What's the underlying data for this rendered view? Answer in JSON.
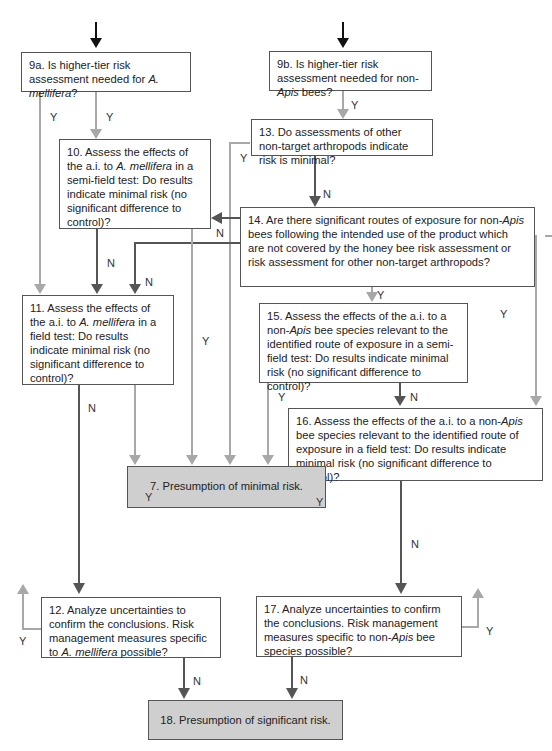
{
  "boxes": {
    "b9a": {
      "pre": "9a. Is higher-tier risk assessment needed for ",
      "it": "A. mellifera",
      "post": "?"
    },
    "b9b": {
      "pre": "9b. Is higher-tier risk assessment needed for non-",
      "it": "Apis",
      "post": " bees?"
    },
    "b13": {
      "text": "13. Do assessments of other non-target arthropods indicate risk is minimal?"
    },
    "b10": {
      "pre": "10. Assess the effects of the a.i. to ",
      "it": "A. mellifera",
      "post": " in a semi-field test: Do results indicate minimal risk (no significant difference to control)?"
    },
    "b14": {
      "pre": "14. Are there significant routes of exposure for non-",
      "it": "Apis",
      "post": " bees following the intended use of the product which are not covered by the honey bee risk assessment or risk assessment for other non-target arthropods?"
    },
    "b11": {
      "pre": "11. Assess the effects of the a.i. to ",
      "it": "A. mellifera",
      "post": " in a field test: Do results indicate minimal risk (no significant difference to control)?"
    },
    "b15": {
      "pre": "15. Assess the effects of the a.i. to a non-",
      "it": "Apis",
      "post": " bee species relevant to the identified route of exposure in a semi-field test: Do results indicate minimal risk (no significant difference to control)?"
    },
    "b16": {
      "pre": "16. Assess the effects of the a.i. to a non-",
      "it": "Apis",
      "post": " bee species relevant to the identified route of exposure in a field test: Do results indicate minimal risk (no significant difference to control)?"
    },
    "b7": {
      "text": "7. Presumption of minimal risk."
    },
    "b12": {
      "pre": "12. Analyze uncertainties to confirm the conclusions. Risk management measures specific to ",
      "it": "A. mellifera",
      "post": " possible?"
    },
    "b17": {
      "pre": "17. Analyze uncertainties to confirm the conclusions. Risk management measures specific to non-",
      "it": "Apis",
      "post": " bee species possible?"
    },
    "b18": {
      "text": "18. Presumption of significant risk."
    }
  },
  "labels": {
    "yes": "Y",
    "no": "N"
  },
  "colors": {
    "yes_line": "#a8a8a8",
    "no_line": "#555555",
    "terminal_fill": "#cfcfcf"
  }
}
